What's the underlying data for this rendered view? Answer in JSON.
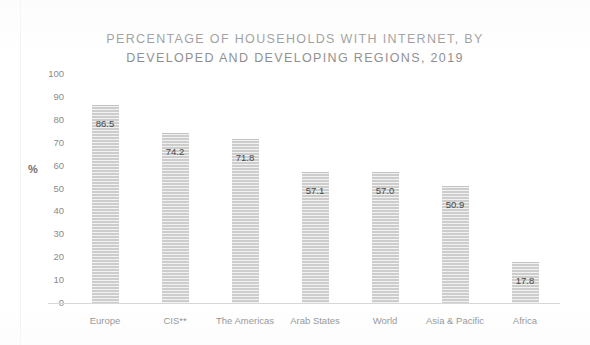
{
  "chart_data": {
    "type": "bar",
    "title": "PERCENTAGE OF HOUSEHOLDS WITH INTERNET, BY DEVELOPED AND DEVELOPING REGIONS, 2019",
    "title_lines": [
      "PERCENTAGE OF HOUSEHOLDS WITH INTERNET, BY",
      "DEVELOPED AND DEVELOPING REGIONS, 2019"
    ],
    "categories": [
      "Europe",
      "CIS**",
      "The Americas",
      "Arab States",
      "World",
      "Asia & Pacific",
      "Africa"
    ],
    "values": [
      86.5,
      74.2,
      71.8,
      57.1,
      57.0,
      50.9,
      17.8
    ],
    "value_labels": [
      "86.5",
      "74.2",
      "71.8",
      "57.1",
      "57.0",
      "50.9",
      "17.8"
    ],
    "xlabel": "",
    "ylabel": "%",
    "ylim": [
      0,
      100
    ],
    "ytick_labels": [
      "100",
      "90",
      "80",
      "70",
      "60",
      "50",
      "40",
      "30",
      "20",
      "10",
      "0"
    ],
    "ytick_values": [
      100,
      90,
      80,
      70,
      60,
      50,
      40,
      30,
      20,
      10,
      0
    ],
    "grid": false,
    "legend": false,
    "bar_color": "#dededd",
    "bar_edge_color": "#c2c2c2",
    "title_color": "#8c8c8c",
    "axis_color": "#d8d8d8",
    "label_color": "#7d7d7d"
  }
}
